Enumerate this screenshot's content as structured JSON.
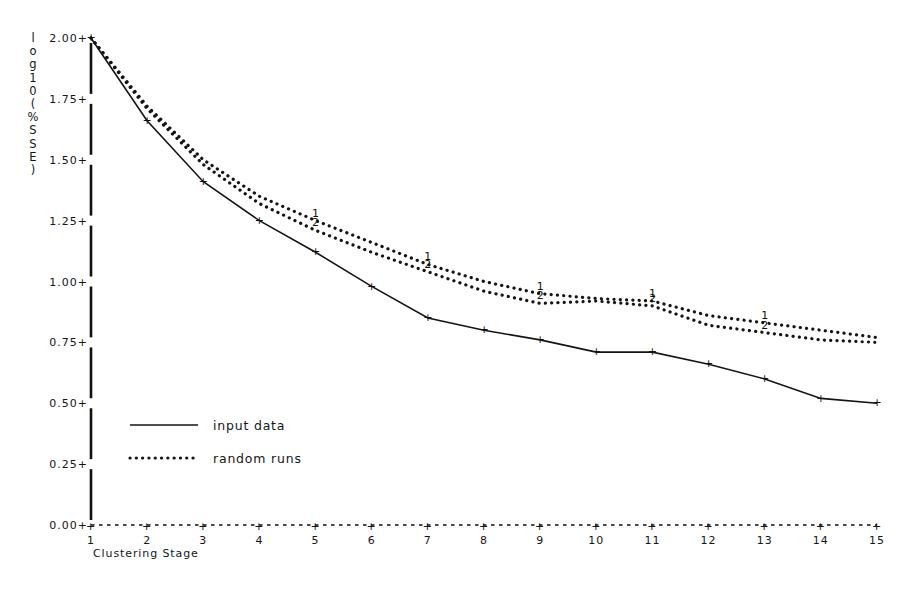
{
  "chart_data": {
    "type": "line",
    "title": "",
    "subtitle": "",
    "xlabel": "Clustering Stage",
    "ylabel": "log10(%SSE)",
    "ylabel_chars": [
      "l",
      "o",
      "g",
      "1",
      "0",
      "(",
      "%",
      "S",
      "S",
      "E",
      ")"
    ],
    "x": [
      1,
      2,
      3,
      4,
      5,
      6,
      7,
      8,
      9,
      10,
      11,
      12,
      13,
      14,
      15
    ],
    "xtick_labels": [
      "1",
      "2",
      "3",
      "4",
      "5",
      "6",
      "7",
      "8",
      "9",
      "10",
      "11",
      "12",
      "13",
      "14",
      "15"
    ],
    "ytick_labels": [
      "0.00+",
      "0.25+",
      "0.50+",
      "0.75+",
      "1.00+",
      "1.25+",
      "1.50+",
      "1.75+",
      "2.00+"
    ],
    "ytick_values": [
      0.0,
      0.25,
      0.5,
      0.75,
      1.0,
      1.25,
      1.5,
      1.75,
      2.0
    ],
    "ylim": [
      0.0,
      2.0
    ],
    "xlim": [
      1,
      15
    ],
    "grid": false,
    "legend_position": "center-left",
    "series": [
      {
        "name": "input data",
        "style": "solid",
        "marker": "+",
        "values": [
          2.0,
          1.66,
          1.41,
          1.25,
          1.12,
          0.98,
          0.85,
          0.8,
          0.76,
          0.71,
          0.71,
          0.66,
          0.6,
          0.52,
          0.5
        ]
      },
      {
        "name": "random runs 1",
        "label": "1",
        "style": "dotted",
        "marker": "1",
        "values": [
          2.0,
          1.72,
          1.5,
          1.35,
          1.25,
          1.16,
          1.07,
          1.0,
          0.95,
          0.93,
          0.92,
          0.86,
          0.83,
          0.8,
          0.77
        ]
      },
      {
        "name": "random runs 2",
        "label": "2",
        "style": "dotted",
        "marker": "2",
        "values": [
          2.0,
          1.71,
          1.48,
          1.32,
          1.21,
          1.12,
          1.04,
          0.96,
          0.91,
          0.92,
          0.9,
          0.82,
          0.79,
          0.76,
          0.75
        ]
      }
    ],
    "legend": [
      {
        "label": "input data",
        "style": "solid"
      },
      {
        "label": "random runs",
        "style": "dotted"
      }
    ]
  }
}
